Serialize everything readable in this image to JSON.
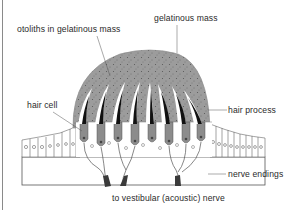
{
  "figure": {
    "labels": {
      "otoliths": "otoliths in gelatinous mass",
      "gelatinous_mass": "gelatinous mass",
      "hair_cell": "hair cell",
      "hair_process": "hair process",
      "nerve_endings": "nerve endings",
      "nerve": "to vestibular (acoustic) nerve"
    },
    "colors": {
      "gelatinous_mass_fill": "#9a9a9a",
      "hair_cell_fill": "#8c8c8c",
      "outline": "#333333",
      "nerve_fiber": "#3a3a3a",
      "background": "#ffffff"
    }
  }
}
